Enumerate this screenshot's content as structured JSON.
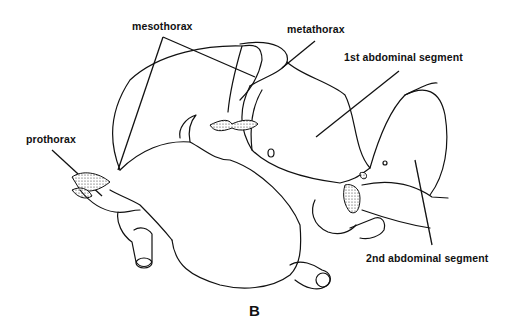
{
  "figure": {
    "panel_label": "B",
    "labels": {
      "mesothorax": "mesothorax",
      "metathorax": "metathorax",
      "abdominal_1": "1st abdominal segment",
      "prothorax": "prothorax",
      "abdominal_2": "2nd abdominal segment"
    }
  }
}
